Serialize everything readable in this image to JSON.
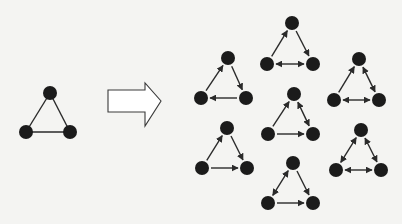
{
  "diagram": {
    "colors": {
      "background": "#f4f4f2",
      "node": "#1b1b1b",
      "edge": "#2a2a2a",
      "arrow_outline": "#3a3a3a",
      "arrow_fill": "#ffffff"
    },
    "node_radius": 7,
    "source": {
      "name": "undirected-triangle",
      "nodes": [
        [
          50,
          93
        ],
        [
          26,
          132
        ],
        [
          70,
          132
        ]
      ],
      "edges": [
        [
          "0",
          "1",
          "none"
        ],
        [
          "0",
          "2",
          "none"
        ],
        [
          "1",
          "2",
          "none"
        ]
      ]
    },
    "transform_arrow": {
      "shaft_left": 108,
      "shaft_right": 145,
      "shaft_top": 90,
      "shaft_bottom": 112,
      "head_top": 83,
      "head_bottom": 126,
      "tip_x": 161,
      "tip_y": 101
    },
    "variants": [
      {
        "name": "triad-cycle",
        "nodes": [
          [
            228,
            58
          ],
          [
            201,
            98
          ],
          [
            246,
            98
          ]
        ],
        "edges": [
          [
            "1",
            "0",
            "forward"
          ],
          [
            "0",
            "2",
            "forward"
          ],
          [
            "2",
            "1",
            "forward"
          ]
        ]
      },
      {
        "name": "triad-mutual-base-top-out",
        "nodes": [
          [
            292,
            23
          ],
          [
            267,
            64
          ],
          [
            313,
            64
          ]
        ],
        "edges": [
          [
            "1",
            "0",
            "forward"
          ],
          [
            "0",
            "2",
            "forward"
          ],
          [
            "1",
            "2",
            "both"
          ]
        ]
      },
      {
        "name": "triad-mutual-right",
        "nodes": [
          [
            294,
            94
          ],
          [
            268,
            134
          ],
          [
            313,
            134
          ]
        ],
        "edges": [
          [
            "1",
            "0",
            "forward"
          ],
          [
            "0",
            "2",
            "both"
          ],
          [
            "1",
            "2",
            "forward"
          ]
        ]
      },
      {
        "name": "triad-two-mutual",
        "nodes": [
          [
            359,
            59
          ],
          [
            334,
            100
          ],
          [
            379,
            100
          ]
        ],
        "edges": [
          [
            "1",
            "0",
            "forward"
          ],
          [
            "0",
            "2",
            "both"
          ],
          [
            "1",
            "2",
            "both"
          ]
        ]
      },
      {
        "name": "triad-transitive",
        "nodes": [
          [
            227,
            128
          ],
          [
            202,
            168
          ],
          [
            247,
            168
          ]
        ],
        "edges": [
          [
            "1",
            "0",
            "forward"
          ],
          [
            "0",
            "2",
            "forward"
          ],
          [
            "1",
            "2",
            "forward"
          ]
        ]
      },
      {
        "name": "triad-all-mutual",
        "nodes": [
          [
            361,
            130
          ],
          [
            336,
            170
          ],
          [
            381,
            170
          ]
        ],
        "edges": [
          [
            "0",
            "1",
            "both"
          ],
          [
            "0",
            "2",
            "both"
          ],
          [
            "1",
            "2",
            "both"
          ]
        ]
      },
      {
        "name": "triad-mutual-left",
        "nodes": [
          [
            293,
            163
          ],
          [
            268,
            203
          ],
          [
            313,
            203
          ]
        ],
        "edges": [
          [
            "0",
            "1",
            "both"
          ],
          [
            "0",
            "2",
            "forward"
          ],
          [
            "1",
            "2",
            "forward"
          ]
        ]
      }
    ]
  }
}
